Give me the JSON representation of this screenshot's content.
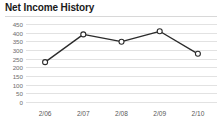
{
  "widget": {
    "title": "Net Income History",
    "background_color": "#ffffff",
    "rule_color": "#d8d8d8"
  },
  "chart_data": {
    "type": "line",
    "title": "Net Income History",
    "xlabel": "",
    "ylabel": "",
    "categories": [
      "2/06",
      "2/07",
      "2/08",
      "2/09",
      "2/10"
    ],
    "values": [
      230,
      390,
      348,
      408,
      278
    ],
    "series": [
      {
        "name": "Net Income",
        "values": [
          230,
          390,
          348,
          408,
          278
        ]
      }
    ],
    "ylim": [
      0,
      450
    ],
    "ytick_labels": [
      "0",
      "50",
      "100",
      "150",
      "200",
      "250",
      "300",
      "350",
      "400",
      "450"
    ],
    "ytick_values": [
      0,
      50,
      100,
      150,
      200,
      250,
      300,
      350,
      400,
      450
    ],
    "xtick_labels": [
      "2/06",
      "2/07",
      "2/08",
      "2/09",
      "2/10"
    ],
    "grid": true,
    "grid_color": "#e2e2e2",
    "legend": false,
    "legend_position": "none",
    "line_color": "#2b2b2b",
    "marker_style": "open-circle",
    "marker_fill": "#ffffff"
  },
  "axis": {
    "y_labels": [
      "450",
      "400",
      "350",
      "300",
      "250",
      "200",
      "150",
      "100",
      "50",
      "0"
    ],
    "x_labels": [
      "2/06",
      "2/07",
      "2/08",
      "2/09",
      "2/10"
    ]
  }
}
